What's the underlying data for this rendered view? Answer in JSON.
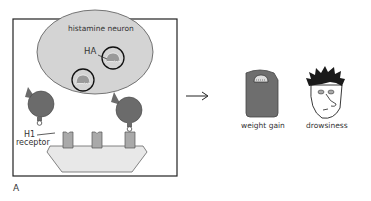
{
  "panel_label": "A",
  "neuron": {
    "label": "histamine neuron",
    "vesicle_label": "HA"
  },
  "receptor": {
    "label_line1": "H1",
    "label_line2": "receptor"
  },
  "effects": [
    {
      "label": "weight gain",
      "icon": "bathroom-scale-icon"
    },
    {
      "label": "drowsiness",
      "icon": "drowsy-face-icon"
    }
  ],
  "colors": {
    "neuron_fill": "#d4d4d4",
    "drug_fill": "#6b6b6b",
    "receptor_fill": "#a9a9a9",
    "membrane_fill": "#e8e8e8",
    "scale_fill": "#6e6e6e"
  }
}
